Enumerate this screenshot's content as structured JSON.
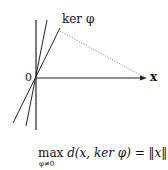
{
  "diagram": {
    "labels": {
      "kernel": "ker φ",
      "origin": "0",
      "vector": "x"
    },
    "formula": {
      "operator": "max",
      "subscript": "φ≠0",
      "expression": "d(x, ker φ) = ‖x‖"
    },
    "colors": {
      "line": "#222222",
      "dotted": "#888888"
    }
  }
}
